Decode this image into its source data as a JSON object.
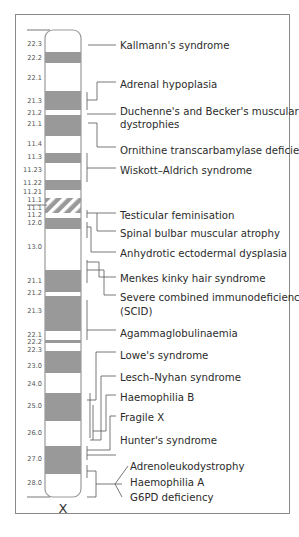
{
  "chromosome": {
    "name": "X",
    "band_color": "#999999",
    "outline_color": "#9a9a9a",
    "line_color": "#666666",
    "bands": [
      {
        "label": "22.3",
        "y0": 30,
        "y1": 52,
        "fill": "white"
      },
      {
        "label": "22.2",
        "y0": 52,
        "y1": 63,
        "fill": "grey"
      },
      {
        "label": "22.1",
        "y0": 63,
        "y1": 91,
        "fill": "white"
      },
      {
        "label": "21.3",
        "y0": 91,
        "y1": 110,
        "fill": "grey"
      },
      {
        "label": "21.2",
        "y0": 110,
        "y1": 115,
        "fill": "white"
      },
      {
        "label": "21.1",
        "y0": 115,
        "y1": 136,
        "fill": "grey"
      },
      {
        "label": "11.4",
        "y0": 136,
        "y1": 153,
        "fill": "white"
      },
      {
        "label": "11.3",
        "y0": 153,
        "y1": 163,
        "fill": "grey"
      },
      {
        "label": "11.23",
        "y0": 163,
        "y1": 180,
        "fill": "white"
      },
      {
        "label": "11.22",
        "y0": 180,
        "y1": 190,
        "fill": "grey"
      },
      {
        "label": "11.21",
        "y0": 190,
        "y1": 198,
        "fill": "white"
      },
      {
        "label": "11.1",
        "y0": 198,
        "y1": 213,
        "fill": "hatch"
      },
      {
        "label": "11.2",
        "y0": 213,
        "y1": 218,
        "fill": "white"
      },
      {
        "label": "12.0",
        "y0": 218,
        "y1": 229,
        "fill": "grey"
      },
      {
        "label": "13.0",
        "y0": 229,
        "y1": 270,
        "fill": "white"
      },
      {
        "label": "21.1",
        "y0": 270,
        "y1": 292,
        "fill": "grey"
      },
      {
        "label": "21.2",
        "y0": 292,
        "y1": 296,
        "fill": "white"
      },
      {
        "label": "21.3",
        "y0": 296,
        "y1": 331,
        "fill": "grey"
      },
      {
        "label": "22.1",
        "y0": 331,
        "y1": 340,
        "fill": "white"
      },
      {
        "label": "22.2",
        "y0": 340,
        "y1": 343,
        "fill": "grey"
      },
      {
        "label": "22.3",
        "y0": 343,
        "y1": 351,
        "fill": "white"
      },
      {
        "label": "23.0",
        "y0": 351,
        "y1": 373,
        "fill": "grey"
      },
      {
        "label": "24.0",
        "y0": 373,
        "y1": 393,
        "fill": "white"
      },
      {
        "label": "25.0",
        "y0": 393,
        "y1": 421,
        "fill": "grey"
      },
      {
        "label": "26.0",
        "y0": 421,
        "y1": 446,
        "fill": "white"
      },
      {
        "label": "27.0",
        "y0": 446,
        "y1": 474,
        "fill": "grey"
      },
      {
        "label": "28.0",
        "y0": 474,
        "y1": 497,
        "fill": "white"
      }
    ],
    "band_label_rows": [
      {
        "text": "22.3",
        "y": 46
      },
      {
        "text": "22.2",
        "y": 60
      },
      {
        "text": "22.1",
        "y": 80
      },
      {
        "text": "21.3",
        "y": 103
      },
      {
        "text": "21.2",
        "y": 115
      },
      {
        "text": "21.1",
        "y": 126
      },
      {
        "text": "11.4",
        "y": 146
      },
      {
        "text": "11.3",
        "y": 159
      },
      {
        "text": "11.23",
        "y": 172
      },
      {
        "text": "11.22",
        "y": 185
      },
      {
        "text": "11.21",
        "y": 194
      },
      {
        "text": "11.1",
        "y": 202
      },
      {
        "text": "11.1",
        "y": 210
      },
      {
        "text": "11.2",
        "y": 217
      },
      {
        "text": "12.0",
        "y": 225
      },
      {
        "text": "13.0",
        "y": 249
      },
      {
        "text": "21.1",
        "y": 283
      },
      {
        "text": "21.2",
        "y": 295
      },
      {
        "text": "21.3",
        "y": 313
      },
      {
        "text": "22.1",
        "y": 337
      },
      {
        "text": "22.2",
        "y": 344
      },
      {
        "text": "22.3",
        "y": 352
      },
      {
        "text": "23.0",
        "y": 368
      },
      {
        "text": "24.0",
        "y": 386
      },
      {
        "text": "25.0",
        "y": 408
      },
      {
        "text": "26.0",
        "y": 435
      },
      {
        "text": "27.0",
        "y": 461
      },
      {
        "text": "28.0",
        "y": 485
      }
    ]
  },
  "diseases": [
    {
      "label": "Kallmann's syndrome",
      "y": 45
    },
    {
      "label": "Adrenal hypoplasia",
      "y": 84
    },
    {
      "label": "Duchenne's and Becker's muscular",
      "y": 111
    },
    {
      "label": "dystrophies",
      "y": 124
    },
    {
      "label": "Ornithine transcarbamylase deficiency",
      "y": 150
    },
    {
      "label": "Wiskott–Aldrich syndrome",
      "y": 170
    },
    {
      "label": "Testicular feminisation",
      "y": 215
    },
    {
      "label": "Spinal bulbar muscular atrophy",
      "y": 233
    },
    {
      "label": "Anhydrotic ectodermal dysplasia",
      "y": 253
    },
    {
      "label": "Menkes kinky hair syndrome",
      "y": 278
    },
    {
      "label": "Severe combined immunodeficiency",
      "y": 297
    },
    {
      "label": "(SCID)",
      "y": 311
    },
    {
      "label": "Agammaglobulinaemia",
      "y": 333
    },
    {
      "label": "Lowe's syndrome",
      "y": 355
    },
    {
      "label": "Lesch–Nyhan syndrome",
      "y": 377
    },
    {
      "label": "Haemophilia B",
      "y": 397
    },
    {
      "label": "Fragile X",
      "y": 417
    },
    {
      "label": "Hunter's syndrome",
      "y": 440
    },
    {
      "label": "Adrenoleukodystrophy",
      "y": 466
    },
    {
      "label": "Haemophilia A",
      "y": 482
    },
    {
      "label": "G6PD deficiency",
      "y": 497
    }
  ]
}
